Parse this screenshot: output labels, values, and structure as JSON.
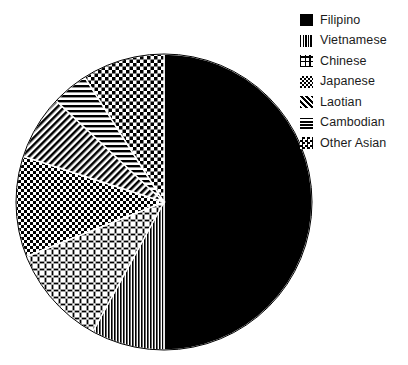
{
  "chart_data": {
    "type": "pie",
    "title": "",
    "subtitle": "",
    "xlabel": "",
    "ylabel": "",
    "legend_position": "top-right",
    "grid": false,
    "start_angle_deg": 0,
    "direction": "clockwise",
    "categories": [
      "Filipino",
      "Vietnamese",
      "Chinese",
      "Japanese",
      "Laotian",
      "Cambodian",
      "Other Asian"
    ],
    "values": [
      50.0,
      8.0,
      11.0,
      11.0,
      7.0,
      4.0,
      9.0
    ],
    "slices": [
      {
        "label": "Filipino",
        "value": 50.0,
        "pattern": "solid-black",
        "color": "#000000",
        "start_angle_deg": 0,
        "end_angle_deg": 180
      },
      {
        "label": "Vietnamese",
        "value": 8.0,
        "pattern": "vertical-stripes",
        "color": "#000000",
        "start_angle_deg": 180,
        "end_angle_deg": 208.8
      },
      {
        "label": "Chinese",
        "value": 11.0,
        "pattern": "cross-dots",
        "color": "#000000",
        "start_angle_deg": 208.8,
        "end_angle_deg": 248.4
      },
      {
        "label": "Japanese",
        "value": 11.0,
        "pattern": "checkerboard-coarse",
        "color": "#000000",
        "start_angle_deg": 248.4,
        "end_angle_deg": 288.0
      },
      {
        "label": "Laotian",
        "value": 7.0,
        "pattern": "diagonal-hatch",
        "color": "#000000",
        "start_angle_deg": 288.0,
        "end_angle_deg": 313.2
      },
      {
        "label": "Cambodian",
        "value": 4.0,
        "pattern": "horizontal-lines",
        "color": "#000000",
        "start_angle_deg": 313.2,
        "end_angle_deg": 327.6
      },
      {
        "label": "Other Asian",
        "value": 9.0,
        "pattern": "checkerboard-fine",
        "color": "#000000",
        "start_angle_deg": 327.6,
        "end_angle_deg": 360
      }
    ],
    "geometry": {
      "center_x": 164,
      "center_y": 202,
      "radius": 148
    }
  },
  "legend": {
    "items": [
      {
        "label": "Filipino",
        "swatch_name": "swatch-solid-black"
      },
      {
        "label": "Vietnamese",
        "swatch_name": "swatch-vertical-stripes"
      },
      {
        "label": "Chinese",
        "swatch_name": "swatch-cross-dots"
      },
      {
        "label": "Japanese",
        "swatch_name": "swatch-checkerboard-coarse"
      },
      {
        "label": "Laotian",
        "swatch_name": "swatch-diagonal-hatch"
      },
      {
        "label": "Cambodian",
        "swatch_name": "swatch-horizontal-lines"
      },
      {
        "label": "Other Asian",
        "swatch_name": "swatch-checkerboard-fine"
      }
    ]
  },
  "colors": {
    "foreground": "#000000",
    "background": "#ffffff",
    "text": "#1b1b1b"
  }
}
